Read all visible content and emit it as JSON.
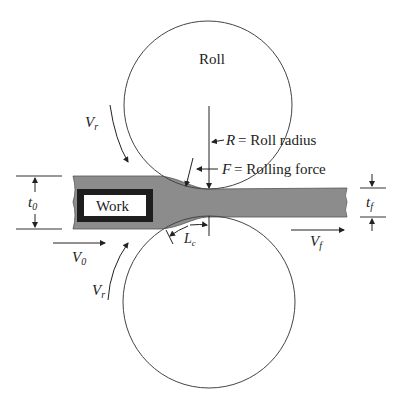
{
  "diagram": {
    "type": "flat rolling process schematic",
    "labels": {
      "top_roll": "Roll",
      "work": "Work",
      "roll_radius": "= Roll radius",
      "roll_radius_symbol": "R",
      "rolling_force": "= Rolling force",
      "rolling_force_symbol": "F",
      "roll_velocity_top": "V",
      "roll_velocity_top_sub": "r",
      "roll_velocity_bottom": "V",
      "roll_velocity_bottom_sub": "r",
      "entry_velocity": "V",
      "entry_velocity_sub": "0",
      "exit_velocity": "V",
      "exit_velocity_sub": "f",
      "initial_thickness": "t",
      "initial_thickness_sub": "0",
      "final_thickness": "t",
      "final_thickness_sub": "f",
      "contact_length": "L",
      "contact_length_sub": "c"
    },
    "colors": {
      "strip": "#8c8c8c",
      "work_border": "#1e1e1e",
      "line": "#333333",
      "background": "#ffffff"
    }
  }
}
